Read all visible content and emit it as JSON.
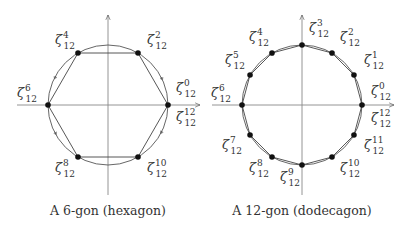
{
  "diagrams": [
    {
      "id": "hexagon",
      "caption": "A 6-gon (hexagon)",
      "center": [
        108,
        105
      ],
      "radius": 60,
      "n": 6,
      "vertex_labels": [
        {
          "sup": "0",
          "sub": "12",
          "x": 176,
          "y": 92
        },
        {
          "sup": "12",
          "sub": "12",
          "x": 176,
          "y": 121
        },
        {
          "sup": "2",
          "sub": "12",
          "x": 147,
          "y": 44
        },
        {
          "sup": "4",
          "sub": "12",
          "x": 55,
          "y": 44
        },
        {
          "sup": "6",
          "sub": "12",
          "x": 17,
          "y": 97
        },
        {
          "sup": "8",
          "sub": "12",
          "x": 55,
          "y": 172
        },
        {
          "sup": "10",
          "sub": "12",
          "x": 147,
          "y": 172
        }
      ]
    },
    {
      "id": "dodecagon",
      "caption": "A 12-gon (dodecagon)",
      "center": [
        302,
        105
      ],
      "radius": 60,
      "n": 12,
      "vertex_labels": [
        {
          "sup": "0",
          "sub": "12",
          "x": 371,
          "y": 95
        },
        {
          "sup": "12",
          "sub": "12",
          "x": 371,
          "y": 122
        },
        {
          "sup": "1",
          "sub": "12",
          "x": 364,
          "y": 64
        },
        {
          "sup": "2",
          "sub": "12",
          "x": 340,
          "y": 41
        },
        {
          "sup": "3",
          "sub": "12",
          "x": 309,
          "y": 32
        },
        {
          "sup": "4",
          "sub": "12",
          "x": 249,
          "y": 41
        },
        {
          "sup": "5",
          "sub": "12",
          "x": 225,
          "y": 64
        },
        {
          "sup": "6",
          "sub": "12",
          "x": 211,
          "y": 97
        },
        {
          "sup": "7",
          "sub": "12",
          "x": 222,
          "y": 149
        },
        {
          "sup": "8",
          "sub": "12",
          "x": 249,
          "y": 172
        },
        {
          "sup": "9",
          "sub": "12",
          "x": 280,
          "y": 181
        },
        {
          "sup": "10",
          "sub": "12",
          "x": 340,
          "y": 172
        },
        {
          "sup": "11",
          "sub": "12",
          "x": 364,
          "y": 149
        }
      ]
    }
  ],
  "symbol": "ζ"
}
